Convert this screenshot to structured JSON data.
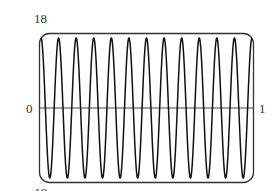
{
  "chart_data": {
    "type": "line",
    "title": "",
    "xlabel": "",
    "ylabel": "",
    "function": "y = 18 cos(24 * pi * x)",
    "cycles": 12,
    "amplitude": 18,
    "xlim": [
      0,
      1
    ],
    "ylim": [
      -18,
      18
    ],
    "grid": false,
    "legend": null,
    "labels": {
      "y_top": "18",
      "y_bottom": "-18",
      "x_left": "0",
      "x_right": "1"
    },
    "series": [
      {
        "name": "curve",
        "color": "#111111",
        "samples": 1200
      }
    ]
  },
  "colors": {
    "frame": "#333333",
    "curve": "#111111",
    "axis": "#444444"
  }
}
